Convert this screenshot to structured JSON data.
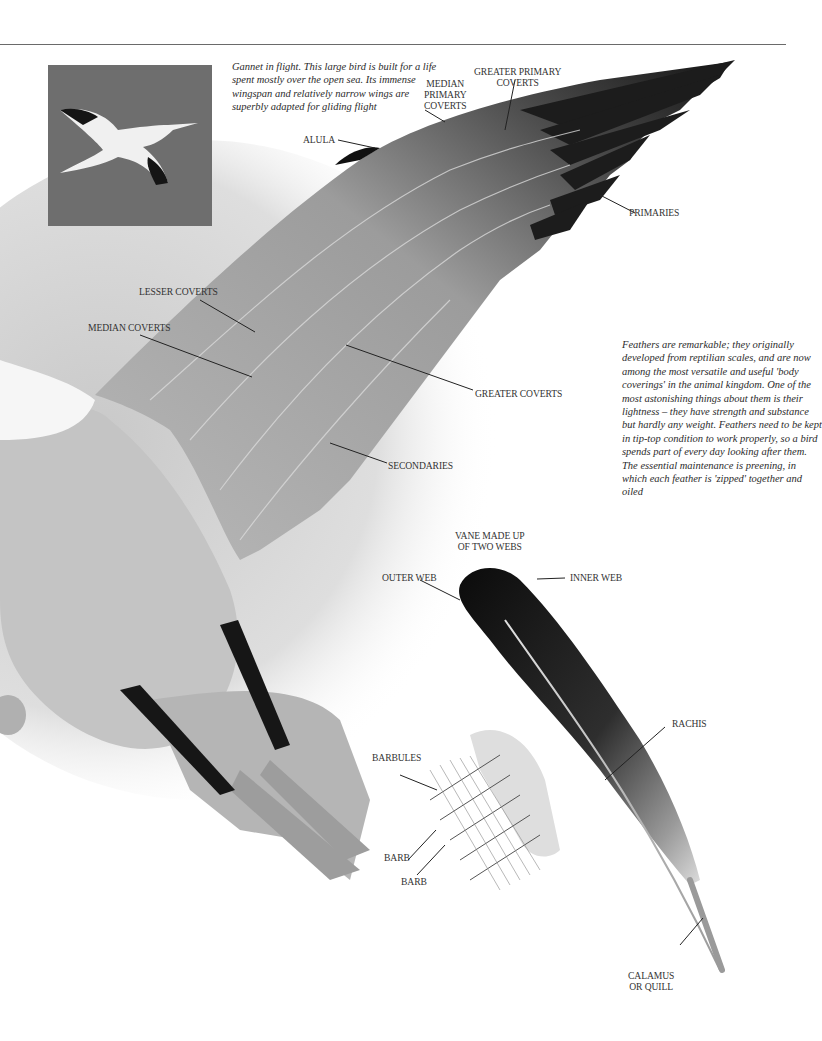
{
  "photo": {
    "subject": "Gannet in flight photograph",
    "caption": "Gannet in flight. This large bird is built for a life spent mostly over the open sea. Its immense wingspan and relatively narrow wings are superbly adapted for gliding flight"
  },
  "side_text": "Feathers are remarkable; they originally developed from reptilian scales, and are now among the most versatile and useful 'body coverings' in the animal kingdom. One of the most astonishing things about them is their lightness – they have strength and substance but hardly any weight. Feathers need to be kept in tip-top condition to work properly, so a bird spends part of every day looking after them. The essential maintenance is preening, in which each feather is 'zipped' together and oiled",
  "wing_labels": {
    "greater_primary_coverts": [
      "GREATER PRIMARY",
      "COVERTS"
    ],
    "median_primary_coverts": [
      "MEDIAN",
      "PRIMARY",
      "COVERTS"
    ],
    "alula": "ALULA",
    "primaries": "PRIMARIES",
    "lesser_coverts": "LESSER COVERTS",
    "median_coverts": "MEDIAN COVERTS",
    "greater_coverts": "GREATER COVERTS",
    "secondaries": "SECONDARIES"
  },
  "feather_labels": {
    "vane": [
      "VANE MADE UP",
      "OF TWO WEBS"
    ],
    "outer_web": "OUTER WEB",
    "inner_web": "INNER WEB",
    "rachis": "RACHIS",
    "barbules": "BARBULES",
    "barb_1": "BARB",
    "barb_2": "BARB",
    "calamus": [
      "CALAMUS",
      "OR QUILL"
    ]
  }
}
